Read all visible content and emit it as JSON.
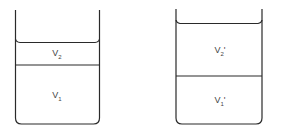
{
  "diagram": {
    "beakers": [
      {
        "id": "left",
        "layers": [
          {
            "name": "V",
            "subscript": "2",
            "prime": ""
          },
          {
            "name": "V",
            "subscript": "1",
            "prime": ""
          }
        ]
      },
      {
        "id": "right",
        "layers": [
          {
            "name": "V",
            "subscript": "2",
            "prime": "'"
          },
          {
            "name": "V",
            "subscript": "1",
            "prime": "'"
          }
        ]
      }
    ],
    "line_color": "#2a2a2a"
  }
}
